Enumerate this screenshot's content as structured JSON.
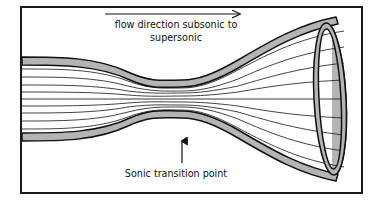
{
  "figure": {
    "title_top_line1": "flow direction subsonic to",
    "title_top_line2": "supersonic",
    "label_bottom": "Sonic transition point",
    "colors": {
      "background": "#ffffff",
      "frame": "#1a1a1a",
      "wall_fill": "#b4b4b4",
      "wall_outline": "#111111",
      "streamline": "#222222",
      "text": "#111111",
      "arrow": "#111111"
    },
    "frame": {
      "x": 21,
      "y": 7,
      "width": 341,
      "height": 186,
      "stroke_width": 2
    },
    "nozzle": {
      "description": "converging-diverging (de Laval) nozzle shown in perspective with elliptical exit plane",
      "throat_x": 182,
      "centerline_y": 99,
      "inlet_half_height": 36,
      "throat_half_height": 13,
      "exit_half_height": 74,
      "wall_band_thickness": 6,
      "streamline_count_per_half": 4
    },
    "exit_ellipse": {
      "center_x": 330,
      "center_y": 99,
      "radius_x": 16,
      "radius_y": 76,
      "rotation_deg": -3,
      "band_thickness": 6
    },
    "flow_arrow": {
      "x_start": 105,
      "x_end": 246,
      "y": 14,
      "direction": "right"
    },
    "transition_arrow": {
      "x": 182,
      "y_start": 163,
      "y_end": 141,
      "direction": "up"
    },
    "text_positions": {
      "top_line1_x": 176,
      "top_line1_y": 28,
      "top_line2_x": 176,
      "top_line2_y": 41,
      "bottom_x": 176,
      "bottom_y": 177
    }
  }
}
